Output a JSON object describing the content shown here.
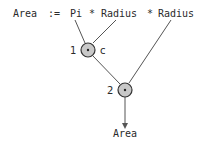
{
  "expression": {
    "target": "Area",
    "assign": ":=",
    "operand1": "Pi",
    "op1": "*",
    "operand2": "Radius",
    "op2": "*",
    "operand3": "Radius"
  },
  "nodes": [
    {
      "id": "1",
      "label": "1",
      "annotation": "c",
      "op": "*"
    },
    {
      "id": "2",
      "label": "2",
      "annotation": "",
      "op": "*"
    }
  ],
  "output": {
    "label": "Area"
  },
  "colors": {
    "line": "#555555",
    "node_fill": "#c8c8c8",
    "node_stroke": "#333333",
    "text": "#2a2a2a"
  }
}
